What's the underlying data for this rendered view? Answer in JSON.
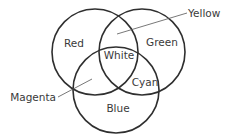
{
  "diagram": {
    "type": "venn",
    "stroke_color": "#2f2f2f",
    "text_color": "#3a3a3a",
    "sets": [
      {
        "id": "red",
        "label": "Red"
      },
      {
        "id": "green",
        "label": "Green"
      },
      {
        "id": "blue",
        "label": "Blue"
      }
    ],
    "intersections": {
      "red_green": {
        "label": "Yellow"
      },
      "green_blue": {
        "label": "Cyan"
      },
      "red_blue": {
        "label": "Magenta"
      },
      "all": {
        "label": "White"
      }
    }
  }
}
